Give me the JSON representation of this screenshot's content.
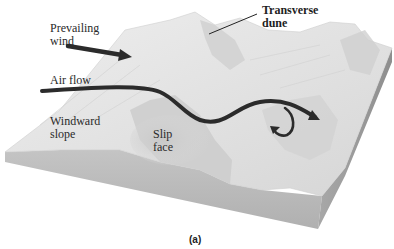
{
  "figure": {
    "caption": "(a)",
    "labels": {
      "prevailing_wind": "Prevailing\nwind",
      "transverse_dune": "Transverse\ndune",
      "air_flow": "Air flow",
      "windward_slope": "Windward\nslope",
      "slip_face": "Slip\nface"
    },
    "arrows": [
      {
        "name": "prevailing-wind-arrow",
        "direction": "right-down"
      },
      {
        "name": "air-flow-arrow",
        "direction": "right, with eddy curl behind slip face"
      }
    ],
    "colors": {
      "background": "#ffffff",
      "sand_top": "#e6e6e6",
      "sand_shadow": "#bdbdbd",
      "front_face": "#b8b8b8",
      "side_face": "#9a9a9a",
      "arrow": "#2b2b2b",
      "text": "#2a2a2a"
    }
  }
}
